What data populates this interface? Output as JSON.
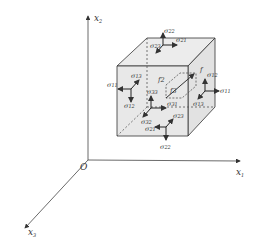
{
  "axes": {
    "origin": "O",
    "x1": {
      "label": "x",
      "sub": "1"
    },
    "x2": {
      "label": "x",
      "sub": "2"
    },
    "x3": {
      "label": "x",
      "sub": "3"
    }
  },
  "stresses": {
    "sym": "σ",
    "top": [
      "22",
      "21",
      "23"
    ],
    "left": [
      "11",
      "12",
      "13"
    ],
    "front": [
      "33",
      "31",
      "32"
    ],
    "bottom": [
      "22",
      "21",
      "23"
    ],
    "back": [
      "33",
      "31",
      "32"
    ],
    "right": [
      "11",
      "12",
      "13"
    ]
  },
  "inner_labels": [
    "f2",
    "f3",
    "f"
  ],
  "colors": {
    "line": "#333333",
    "face": "#e6e6e6",
    "hidden": "#555555"
  }
}
